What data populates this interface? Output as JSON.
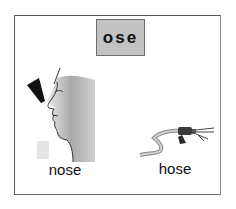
{
  "card": {
    "word_family": "ose",
    "items": [
      {
        "label": "nose",
        "picture": "nose-face-illustration"
      },
      {
        "label": "hose",
        "picture": "garden-hose-illustration"
      }
    ]
  },
  "colors": {
    "word_box_fill": "#c2c2c2",
    "word_box_border": "#6e6e6e",
    "frame_border": "#555555",
    "text": "#111111"
  }
}
